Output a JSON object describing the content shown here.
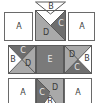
{
  "diagram": {
    "title": "",
    "colors": {
      "A": "#ffffff",
      "B": "#ffffff",
      "C": "#6e6e6e",
      "D": "#a9a9a9",
      "E": "#7a7a7a",
      "outline": "#5a5a5a"
    },
    "labels": {
      "top_left": "A",
      "top_right": "A",
      "top_center_b": "B",
      "top_center_c": "C",
      "top_center_d": "D",
      "mid_left_c": "C",
      "mid_left_b": "B",
      "mid_left_d": "D",
      "mid_center": "E",
      "mid_right_d": "D",
      "mid_right_b": "B",
      "mid_right_c": "C",
      "bot_left": "A",
      "bot_right": "A",
      "bot_center_c": "C",
      "bot_center_d": "D",
      "bot_center_b": "B"
    },
    "rows": [
      {
        "name": "top",
        "blocks": [
          "A",
          "B/C/D triangles",
          "A"
        ]
      },
      {
        "name": "middle",
        "blocks": [
          "C/B/D triangles",
          "E",
          "D/B/C triangles"
        ]
      },
      {
        "name": "bottom",
        "blocks": [
          "A",
          "C/D/B triangles",
          "A"
        ]
      }
    ]
  }
}
